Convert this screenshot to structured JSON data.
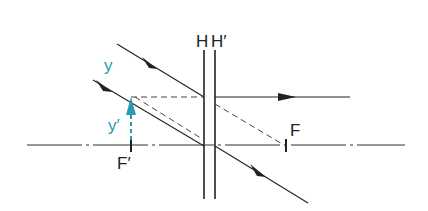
{
  "diagram": {
    "labels": {
      "H": "H",
      "H_prime": "H′",
      "F": "F",
      "F_prime": "F′",
      "y": "y",
      "y_prime": "y′"
    },
    "colors": {
      "line": "#222222",
      "object_arrow": "#2a9ab3",
      "background": "#ffffff"
    },
    "geometry": {
      "optical_axis_y": 145,
      "plane_H_x": 204,
      "plane_H_prime_x": 215,
      "F_prime_x": 131,
      "F_x": 286,
      "object_top_y": 97
    }
  }
}
